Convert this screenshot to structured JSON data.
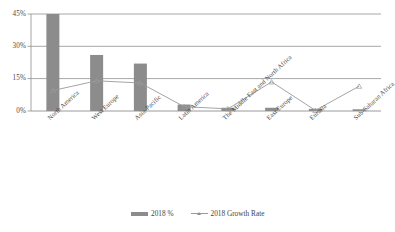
{
  "chart_data": {
    "type": "bar",
    "title": "",
    "xlabel": "",
    "ylabel": "",
    "grid": true,
    "legend_position": "bottom",
    "ylim": [
      0,
      45
    ],
    "yticks": [
      "0%",
      "15%",
      "30%",
      "45%"
    ],
    "ytick_values": [
      0,
      15,
      30,
      45
    ],
    "categories": [
      "North America",
      "West Europe",
      "Asia-Pacific",
      "Latin America",
      "The Middle East and North Africa",
      "East Europe",
      "Eurasia",
      "Sub-Saharan Africa"
    ],
    "series": [
      {
        "name": "2018 %",
        "type": "bar",
        "color": "#8c8c8c",
        "values": [
          45.0,
          26.0,
          22.0,
          3.0,
          1.5,
          1.5,
          1.0,
          0.8
        ]
      },
      {
        "name": "2018 Growth Rate",
        "type": "line",
        "color": "#9a9a9a",
        "marker": "triangle",
        "values": [
          9.5,
          14.0,
          13.0,
          2.0,
          1.0,
          13.5,
          0.3,
          11.5
        ]
      }
    ]
  },
  "legend": {
    "bar_label": "2018 %",
    "line_label": "2018 Growth Rate"
  },
  "colors": {
    "bar": "#8c8c8c",
    "line": "#9a9a9a",
    "gridline": "#8f8f8f",
    "axis": "#7a7a7a",
    "text": "#4a4a4a",
    "background": "#ffffff"
  }
}
